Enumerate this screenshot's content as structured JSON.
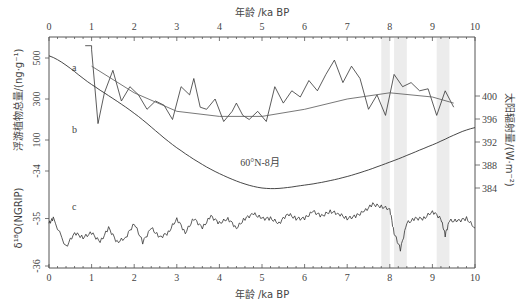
{
  "chart_data": {
    "type": "line",
    "title": "",
    "xlabel_top": "年龄 /ka BP",
    "xlabel_bottom": "年龄 /ka BP",
    "xlim": [
      0,
      10
    ],
    "x_ticks": [
      "0",
      "1",
      "2",
      "3",
      "4",
      "5",
      "6",
      "7",
      "8",
      "9",
      "10"
    ],
    "left_axis_upper": {
      "label": "浮游植物总量/(ng·g⁻¹)",
      "ticks": [
        "500",
        "300",
        "100"
      ]
    },
    "left_axis_lower": {
      "label": "δ¹⁸O(NGRIP)",
      "ticks": [
        "-34",
        "-35",
        "-36"
      ],
      "ylim": [
        -36,
        -34
      ]
    },
    "right_axis": {
      "label": "太阳辐射量/(W·m⁻²)",
      "ticks": [
        "400",
        "396",
        "392",
        "388",
        "384"
      ]
    },
    "annotation": "60°N-8月",
    "shaded_bands_ka": [
      [
        7.8,
        8.0
      ],
      [
        8.1,
        8.4
      ],
      [
        9.1,
        9.4
      ]
    ],
    "series": [
      {
        "name": "a",
        "label": "浮游植物总量",
        "axis": "left_upper",
        "x": [
          1.0,
          1.15,
          1.3,
          1.5,
          1.7,
          1.9,
          2.1,
          2.3,
          2.5,
          2.7,
          2.9,
          3.1,
          3.3,
          3.4,
          3.55,
          3.7,
          3.9,
          4.1,
          4.3,
          4.4,
          4.55,
          4.7,
          4.9,
          5.1,
          5.3,
          5.5,
          5.7,
          5.9,
          6.1,
          6.3,
          6.5,
          6.7,
          6.9,
          7.1,
          7.3,
          7.5,
          7.7,
          7.9,
          8.1,
          8.3,
          8.5,
          8.7,
          8.9,
          9.1,
          9.3,
          9.5
        ],
        "y": [
          540,
          180,
          330,
          440,
          290,
          360,
          320,
          250,
          290,
          270,
          200,
          360,
          320,
          400,
          260,
          250,
          300,
          190,
          240,
          280,
          220,
          200,
          240,
          190,
          360,
          280,
          340,
          310,
          390,
          340,
          420,
          490,
          380,
          460,
          400,
          250,
          320,
          220,
          420,
          360,
          380,
          340,
          350,
          220,
          340,
          260
        ]
      },
      {
        "name": "a-trend",
        "label": "浮游植物总量趋势线",
        "axis": "left_upper",
        "x": [
          1,
          2,
          3,
          4,
          5,
          6,
          7,
          8,
          9,
          9.5
        ],
        "y": [
          460,
          330,
          240,
          215,
          215,
          250,
          300,
          330,
          310,
          280
        ]
      },
      {
        "name": "b",
        "label": "60°N-8月太阳辐射量",
        "axis": "right",
        "x": [
          0,
          1,
          2,
          3,
          4,
          5,
          6,
          7,
          8,
          9,
          10
        ],
        "y": [
          407,
          402,
          397,
          391,
          386.5,
          384,
          384.5,
          386,
          388.5,
          391.5,
          394.5
        ]
      },
      {
        "name": "c",
        "label": "δ¹⁸O(NGRIP)",
        "axis": "left_lower",
        "x": [
          0,
          0.1,
          0.4,
          0.6,
          0.8,
          1.0,
          1.2,
          1.4,
          1.6,
          1.8,
          2.0,
          2.2,
          2.4,
          2.6,
          2.8,
          3.0,
          3.2,
          3.4,
          3.6,
          3.8,
          4.0,
          4.2,
          4.4,
          4.6,
          4.8,
          5.0,
          5.2,
          5.4,
          5.6,
          5.8,
          6.0,
          6.2,
          6.4,
          6.6,
          6.8,
          7.0,
          7.2,
          7.4,
          7.6,
          7.8,
          8.0,
          8.1,
          8.25,
          8.4,
          8.6,
          8.8,
          9.0,
          9.2,
          9.3,
          9.4,
          9.6,
          9.8,
          10.0
        ],
        "y": [
          -35.1,
          -35.0,
          -35.6,
          -35.3,
          -35.4,
          -35.3,
          -35.5,
          -35.2,
          -35.5,
          -35.4,
          -35.1,
          -35.5,
          -35.2,
          -35.4,
          -35.3,
          -35.0,
          -35.3,
          -35.0,
          -35.2,
          -34.95,
          -35.1,
          -35.0,
          -35.2,
          -35.0,
          -34.9,
          -35.0,
          -35.0,
          -35.1,
          -34.9,
          -35.0,
          -35.0,
          -34.85,
          -34.95,
          -34.85,
          -34.9,
          -35.0,
          -34.95,
          -34.85,
          -34.7,
          -34.75,
          -34.8,
          -35.3,
          -35.65,
          -35.1,
          -35.0,
          -35.0,
          -34.85,
          -35.0,
          -35.35,
          -35.05,
          -35.05,
          -35.0,
          -35.2
        ]
      }
    ],
    "panel_labels": [
      "a",
      "b",
      "c"
    ]
  }
}
